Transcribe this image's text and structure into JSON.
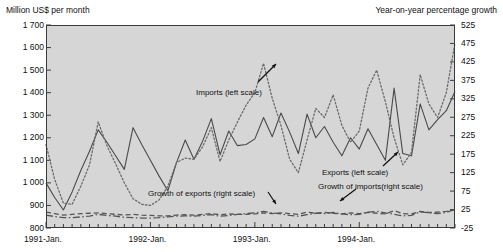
{
  "chart_data": {
    "type": "line",
    "title": "",
    "xlabel": "",
    "ylabel": "Million US$ per month",
    "y2label": "Year-on-year percentage growth",
    "grid": false,
    "legend_position": "inline-annotations",
    "ylim": [
      800,
      1700
    ],
    "y2lim": [
      -25,
      525
    ],
    "yticks": [
      "800",
      "900",
      "1 000",
      "1 100",
      "1 200",
      "1 300",
      "1 400",
      "1 500",
      "1 600",
      "1 700"
    ],
    "y2ticks": [
      "-25",
      "25",
      "75",
      "125",
      "175",
      "225",
      "275",
      "325",
      "375",
      "425",
      "475",
      "525"
    ],
    "xticks": [
      "1991-Jan.",
      "1992-Jan.",
      "1993-Jan.",
      "1994-Jan."
    ],
    "xtick_positions": [
      0,
      12,
      24,
      36
    ],
    "x_count": 48,
    "annotations": [
      {
        "text": "Imports (left scale)",
        "x": 196,
        "y": 88
      },
      {
        "text": "Exports (left scale)",
        "x": 322,
        "y": 168
      },
      {
        "text": "Growth of exports (right scale)",
        "x": 148,
        "y": 189
      },
      {
        "text": "Growth of imports(right scale)",
        "x": 318,
        "y": 182
      }
    ],
    "series": [
      {
        "name": "Exports (left scale)",
        "axis": "left",
        "style": "solid",
        "color": "#4a4a4a",
        "values": [
          1000,
          935,
          880,
          960,
          1055,
          1140,
          1235,
          1180,
          1120,
          1060,
          1245,
          1170,
          1100,
          1030,
          965,
          1090,
          1190,
          1105,
          1185,
          1285,
          1125,
          1230,
          1165,
          1170,
          1195,
          1290,
          1205,
          1310,
          1225,
          1130,
          1305,
          1200,
          1250,
          1180,
          1120,
          1200,
          1150,
          1240,
          1170,
          1100,
          1420,
          1130,
          1120,
          1350,
          1235,
          1280,
          1320,
          1405
        ]
      },
      {
        "name": "Imports (left scale)",
        "axis": "left",
        "style": "dotted",
        "color": "#6b6b6b",
        "values": [
          1170,
          1015,
          910,
          905,
          985,
          1080,
          1270,
          1165,
          1085,
          1000,
          930,
          905,
          900,
          925,
          985,
          1090,
          1110,
          1105,
          1160,
          1245,
          1095,
          1190,
          1270,
          1345,
          1400,
          1530,
          1375,
          1255,
          1105,
          1045,
          1190,
          1330,
          1290,
          1390,
          1255,
          1180,
          1230,
          1420,
          1500,
          1360,
          1200,
          1080,
          1135,
          1480,
          1350,
          1290,
          1400,
          1620
        ]
      },
      {
        "name": "Growth of exports (right scale)",
        "axis": "right",
        "style": "dashed",
        "color": "#555555",
        "values": [
          18,
          14,
          10,
          12,
          14,
          15,
          16,
          14,
          12,
          10,
          12,
          10,
          9,
          8,
          8,
          10,
          11,
          10,
          12,
          14,
          11,
          13,
          12,
          12,
          13,
          16,
          14,
          16,
          14,
          12,
          18,
          15,
          17,
          15,
          13,
          16,
          14,
          17,
          15,
          13,
          22,
          14,
          13,
          20,
          17,
          18,
          20,
          24
        ]
      },
      {
        "name": "Growth of imports(right scale)",
        "axis": "right",
        "style": "dashdot",
        "color": "#555555",
        "values": [
          10,
          6,
          3,
          3,
          5,
          7,
          12,
          9,
          7,
          4,
          3,
          2,
          2,
          3,
          5,
          7,
          8,
          7,
          9,
          11,
          7,
          9,
          12,
          14,
          16,
          20,
          16,
          13,
          9,
          7,
          11,
          15,
          14,
          17,
          13,
          11,
          12,
          18,
          20,
          16,
          12,
          8,
          9,
          19,
          16,
          14,
          17,
          26
        ]
      }
    ]
  },
  "colors": {
    "plot_background": "#d6d6d6",
    "axis": "#3b3b3b",
    "exports_line": "#4a4a4a",
    "imports_line": "#6b6b6b"
  }
}
